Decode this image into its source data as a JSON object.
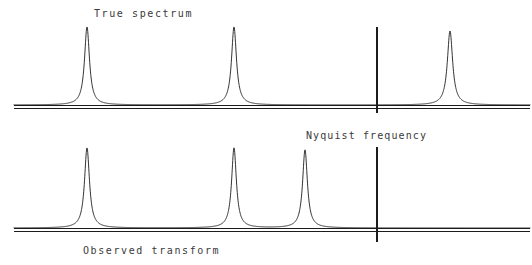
{
  "figure": {
    "title_top": "True spectrum",
    "title_bottom": "Observed transform",
    "nyquist_label": "Nyquist frequency",
    "ink_color": "#1c1c1c",
    "text_color": "#3a3a3a",
    "background_color": "#ffffff",
    "width": 532,
    "height": 265
  },
  "chart_data": {
    "type": "line",
    "xlabel": "",
    "ylabel": "",
    "xlim": [
      0,
      532
    ],
    "ylim": [
      0,
      1
    ],
    "grid": false,
    "legend": "none",
    "annotations": [
      {
        "name": "true-spectrum-label",
        "text": "True spectrum",
        "x": 94,
        "y": 17
      },
      {
        "name": "nyquist-frequency-label",
        "text": "Nyquist frequency",
        "x": 306,
        "y": 139
      },
      {
        "name": "observed-transform-label",
        "text": "Observed transform",
        "x": 83,
        "y": 254
      }
    ],
    "nyquist_frequency_x": 377,
    "panels": [
      {
        "name": "true-spectrum",
        "label": "True spectrum",
        "baseline_y": 105,
        "baseline_x_start": 14,
        "baseline_x_end": 530,
        "baseline_double_offset": 3.5,
        "peak_top_y": 27,
        "nyquist_line": {
          "x": 377,
          "y_top": 27,
          "y_bottom": 113
        },
        "peaks": [
          {
            "center": 87,
            "height": 78,
            "halfwidth": 3.0
          },
          {
            "center": 234,
            "height": 78,
            "halfwidth": 3.0
          },
          {
            "center": 450,
            "height": 74,
            "halfwidth": 3.2
          }
        ]
      },
      {
        "name": "observed-transform",
        "label": "Observed transform",
        "baseline_y": 228,
        "baseline_x_start": 14,
        "baseline_x_end": 530,
        "baseline_double_offset": 3.5,
        "peak_top_y": 148,
        "nyquist_line": {
          "x": 377,
          "y_top": 147,
          "y_bottom": 242
        },
        "peaks": [
          {
            "center": 87,
            "height": 80,
            "halfwidth": 3.0
          },
          {
            "center": 234,
            "height": 80,
            "halfwidth": 2.9
          },
          {
            "center": 305,
            "height": 78,
            "halfwidth": 2.9
          }
        ]
      }
    ]
  }
}
